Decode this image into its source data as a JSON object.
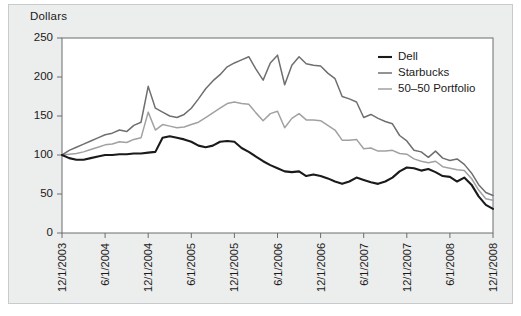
{
  "figure": {
    "panel_background": "#eceded",
    "plot_background": "#ffffff",
    "axis_color": "#6b6c6e",
    "text_color": "#1a1a1a"
  },
  "chart_data": {
    "type": "line",
    "title": "",
    "subtitle": "",
    "xlabel": "",
    "ylabel": "Dollars",
    "ylim": [
      0,
      250
    ],
    "yticks": [
      0,
      50,
      100,
      150,
      200,
      250
    ],
    "grid": false,
    "legend_position": "top-right",
    "x": [
      "12/1/2003",
      "1/1/2004",
      "2/1/2004",
      "3/1/2004",
      "4/1/2004",
      "5/1/2004",
      "6/1/2004",
      "7/1/2004",
      "8/1/2004",
      "9/1/2004",
      "10/1/2004",
      "11/1/2004",
      "12/1/2004",
      "1/1/2005",
      "2/1/2005",
      "3/1/2005",
      "4/1/2005",
      "5/1/2005",
      "6/1/2005",
      "7/1/2005",
      "8/1/2005",
      "9/1/2005",
      "10/1/2005",
      "11/1/2005",
      "12/1/2005",
      "1/1/2006",
      "2/1/2006",
      "3/1/2006",
      "4/1/2006",
      "5/1/2006",
      "6/1/2006",
      "7/1/2006",
      "8/1/2006",
      "9/1/2006",
      "10/1/2006",
      "11/1/2006",
      "12/1/2006",
      "1/1/2007",
      "2/1/2007",
      "3/1/2007",
      "4/1/2007",
      "5/1/2007",
      "6/1/2007",
      "7/1/2007",
      "8/1/2007",
      "9/1/2007",
      "10/1/2007",
      "11/1/2007",
      "12/1/2007",
      "1/1/2008",
      "2/1/2008",
      "3/1/2008",
      "4/1/2008",
      "5/1/2008",
      "6/1/2008",
      "7/1/2008",
      "8/1/2008",
      "9/1/2008",
      "10/1/2008",
      "11/1/2008",
      "12/1/2008"
    ],
    "xticks": [
      "12/1/2003",
      "6/1/2004",
      "12/1/2004",
      "6/1/2005",
      "12/1/2005",
      "6/1/2006",
      "12/1/2006",
      "6/1/2007",
      "12/1/2007",
      "6/1/2008",
      "12/1/2008"
    ],
    "xtick_indices": [
      0,
      6,
      12,
      18,
      24,
      30,
      36,
      42,
      48,
      54,
      60
    ],
    "series": [
      {
        "name": "Dell",
        "color": "#1a1a1a",
        "width": 2.1,
        "values": [
          100,
          96,
          94,
          94,
          96,
          98,
          100,
          100,
          101,
          101,
          102,
          102,
          103,
          104,
          122,
          124,
          122,
          120,
          117,
          112,
          110,
          112,
          117,
          118,
          117,
          109,
          104,
          98,
          92,
          87,
          83,
          79,
          78,
          79,
          73,
          75,
          73,
          70,
          66,
          63,
          66,
          71,
          68,
          65,
          63,
          66,
          71,
          79,
          84,
          83,
          80,
          82,
          78,
          73,
          72,
          66,
          71,
          62,
          47,
          36,
          31
        ]
      },
      {
        "name": "Starbucks",
        "color": "#6e6f71",
        "width": 1.5,
        "values": [
          100,
          106,
          110,
          114,
          118,
          122,
          126,
          128,
          132,
          130,
          138,
          142,
          188,
          160,
          155,
          150,
          148,
          152,
          160,
          172,
          185,
          195,
          203,
          213,
          218,
          222,
          226,
          210,
          196,
          218,
          228,
          190,
          215,
          226,
          217,
          215,
          214,
          205,
          198,
          175,
          172,
          168,
          148,
          152,
          147,
          143,
          140,
          125,
          118,
          106,
          104,
          97,
          105,
          96,
          93,
          95,
          88,
          77,
          62,
          52,
          48
        ]
      },
      {
        "name": "50–50 Portfolio",
        "color": "#a0a1a3",
        "width": 1.5,
        "values": [
          100,
          101,
          102,
          104,
          107,
          110,
          113,
          114,
          117,
          116,
          120,
          122,
          155,
          132,
          139,
          137,
          135,
          136,
          139,
          142,
          148,
          154,
          160,
          166,
          168,
          166,
          165,
          154,
          144,
          153,
          156,
          135,
          147,
          153,
          145,
          145,
          144,
          138,
          132,
          119,
          119,
          120,
          108,
          109,
          105,
          105,
          106,
          102,
          101,
          95,
          92,
          90,
          92,
          85,
          83,
          81,
          80,
          70,
          55,
          44,
          42
        ]
      }
    ]
  },
  "legend": {
    "items": [
      {
        "label": "Dell"
      },
      {
        "label": "Starbucks"
      },
      {
        "label": "50–50 Portfolio"
      }
    ]
  }
}
